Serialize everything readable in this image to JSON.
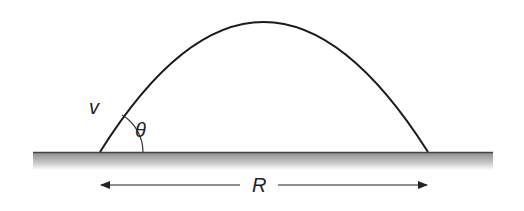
{
  "diagram": {
    "type": "projectile-motion",
    "labels": {
      "velocity": "v",
      "angle": "θ",
      "range": "R"
    },
    "geometry": {
      "launch_point": [
        100,
        152
      ],
      "landing_point": [
        428,
        152
      ],
      "apex": [
        263,
        22
      ],
      "ground_y": 152,
      "ground_x_range": [
        33,
        493
      ],
      "range_arrow_y": 185
    },
    "colors": {
      "trajectory": "#1a1a1a",
      "ground_top": "#444444",
      "ground_fill_start": "#8a8a8a",
      "ground_fill_end": "#ffffff",
      "text": "#222222"
    }
  }
}
